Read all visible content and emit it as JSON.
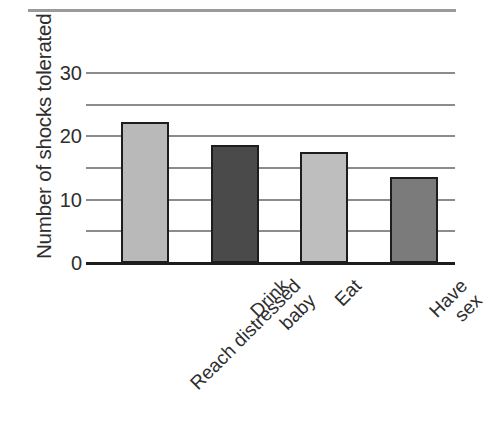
{
  "figure": {
    "top_rule_visible": true
  },
  "chart_data": {
    "type": "bar",
    "title": "",
    "xlabel": "",
    "ylabel": "Number of shocks tolerated",
    "categories": [
      "Reach distressed\nbaby",
      "Drink",
      "Eat",
      "Have sex"
    ],
    "values": [
      22.3,
      18.6,
      17.5,
      13.6
    ],
    "bar_colors": [
      "#b9b9b9",
      "#4a4a4a",
      "#bebebe",
      "#7b7b7b"
    ],
    "bar_edge_color": "#1d1d1d",
    "ylim": [
      0,
      32
    ],
    "yticks": [
      0,
      10,
      20,
      30
    ],
    "ytick_labels": [
      "0",
      "10",
      "20",
      "30"
    ],
    "gridlines": [
      0,
      5,
      10,
      15,
      20,
      25,
      30
    ],
    "grid": true,
    "grid_color": "#8c8c8c",
    "axis_color": "#1d1d1d",
    "legend": "none"
  }
}
